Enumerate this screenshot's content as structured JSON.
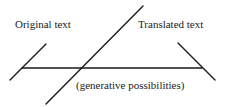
{
  "diagram": {
    "labels": {
      "original": "Original text",
      "translated": "Translated text",
      "generative": "(generative possibilities)"
    },
    "lines": [
      {
        "name": "original-line",
        "x1": 10,
        "y1": 80,
        "x2": 46,
        "y2": 44
      },
      {
        "name": "translated-line",
        "x1": 178,
        "y1": 43,
        "x2": 215,
        "y2": 80
      },
      {
        "name": "generative-axis",
        "x1": 22,
        "y1": 68,
        "x2": 202,
        "y2": 68
      },
      {
        "name": "crossing-diagonal",
        "x1": 46,
        "y1": 104,
        "x2": 143,
        "y2": 6
      }
    ],
    "stroke_color": "#1a1a1a"
  }
}
